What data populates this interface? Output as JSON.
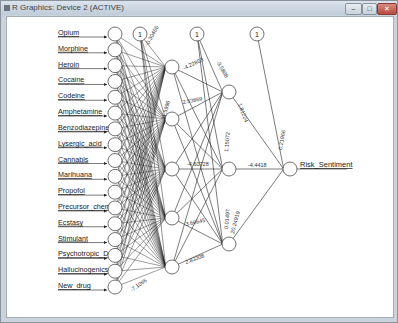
{
  "window": {
    "title": "R Graphics: Device 2 (ACTIVE)",
    "buttons": {
      "minimize": "–",
      "maximize": "□",
      "close": "✕"
    }
  },
  "diagram": {
    "type": "neural-network",
    "inputs": [
      "Opium",
      "Morphine",
      "Heroin",
      "Cocaine",
      "Codeine",
      "Amphetamine",
      "Benzodiazepine",
      "Lysergic_acid",
      "Cannabis",
      "Marihuana",
      "Propofol",
      "Precursor_chem",
      "Ecstasy",
      "Stimulant",
      "Psychotropic_D",
      "Hallucinogenics",
      "New_drug"
    ],
    "input_labels_display": [
      "Opium",
      "Morphine",
      "Heroin",
      "Cocaine",
      "Codeine",
      "Amphetamine",
      "Benzodiazepine",
      "Lysergic_acid",
      "Cannabis",
      "Marihuana",
      "Propofol",
      "Precursor_chem",
      "Ecstasy",
      "Stimulant",
      "Psychotropic_D",
      "Hallucinogenics",
      "New_drug"
    ],
    "bias_label": "1",
    "hidden1_count": 5,
    "hidden2_count": 3,
    "output_label": "Risk_Sentiment",
    "weight_labels": {
      "bias1_to_h1_top": "-0.30466",
      "h1_1_to_h2_1": "-4.22803",
      "h1_2_to_h2_1": "2.53869",
      "h1_3_to_h2_2": "-4.60728",
      "h1_4_to_h2_3": "3.66645",
      "h1_5_to_h2_3": "2.83308",
      "bias2_to_h2_1": "-3.5808",
      "h2_1_to_out": "1.81224",
      "h2_2_to_out": "-4.4418",
      "h2_3_to_out": "0.01497",
      "bias2_to_h2_3": "20.24919",
      "h2_2_bias": "1.15072",
      "bias3_to_out": "0.21966",
      "misc_h1": [
        "11.5996",
        "-0.10845",
        "1.1066",
        "-4.0287",
        "-7.1066"
      ]
    }
  }
}
